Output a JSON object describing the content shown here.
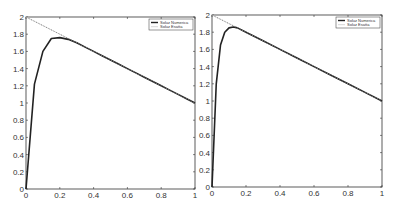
{
  "chart_data": [
    {
      "type": "line",
      "title": "",
      "xlabel": "",
      "ylabel": "",
      "xlim": [
        0,
        1
      ],
      "ylim": [
        0,
        2
      ],
      "xticks": [
        "0",
        "0.2",
        "0.4",
        "0.6",
        "0.8",
        "1"
      ],
      "yticks": [
        "0",
        "0.2",
        "0.4",
        "0.6",
        "0.8",
        "1",
        "1.2",
        "1.4",
        "1.6",
        "1.8",
        "2"
      ],
      "grid": false,
      "legend_position": "top-right",
      "series": [
        {
          "name": "Soluz Numerica",
          "style": "solid-thick-dark",
          "x": [
            0,
            0.05,
            0.1,
            0.15,
            0.2,
            0.25,
            0.3,
            0.35,
            0.4,
            0.45,
            0.5,
            0.55,
            0.6,
            0.65,
            0.7,
            0.75,
            0.8,
            0.85,
            0.9,
            0.95,
            1.0
          ],
          "y": [
            0,
            1.22,
            1.6,
            1.75,
            1.76,
            1.74,
            1.7,
            1.65,
            1.6,
            1.55,
            1.5,
            1.45,
            1.4,
            1.35,
            1.3,
            1.25,
            1.2,
            1.15,
            1.1,
            1.05,
            1.0
          ]
        },
        {
          "name": "Soluz Esatta",
          "style": "thin-light-dotted",
          "x": [
            0,
            1
          ],
          "y": [
            2,
            1
          ]
        }
      ]
    },
    {
      "type": "line",
      "title": "",
      "xlabel": "",
      "ylabel": "",
      "xlim": [
        0,
        1
      ],
      "ylim": [
        0,
        2
      ],
      "xticks": [
        "0",
        "0.2",
        "0.4",
        "0.6",
        "0.8",
        "1"
      ],
      "yticks": [
        "0",
        "0.2",
        "0.4",
        "0.6",
        "0.8",
        "1",
        "1.2",
        "1.4",
        "1.6",
        "1.8",
        "2"
      ],
      "grid": false,
      "legend_position": "top-right",
      "series": [
        {
          "name": "Soluz Numerica",
          "style": "solid-thick-dark",
          "x": [
            0,
            0.025,
            0.05,
            0.075,
            0.1,
            0.125,
            0.15,
            0.2,
            0.3,
            0.4,
            0.5,
            0.6,
            0.7,
            0.8,
            0.9,
            1.0
          ],
          "y": [
            0,
            1.2,
            1.65,
            1.8,
            1.85,
            1.86,
            1.85,
            1.8,
            1.7,
            1.6,
            1.5,
            1.4,
            1.3,
            1.2,
            1.1,
            1.0
          ]
        },
        {
          "name": "Soluz Esatta",
          "style": "thin-light-dotted",
          "x": [
            0,
            1
          ],
          "y": [
            2,
            1
          ]
        }
      ]
    }
  ],
  "panels": [
    {
      "legend": {
        "items": [
          "Soluz Numerica",
          "Soluz Esatta"
        ]
      }
    },
    {
      "legend": {
        "items": [
          "Soluz Numerica",
          "Soluz Esatta"
        ]
      }
    }
  ],
  "colors": {
    "numeric": "#222222",
    "exact": "#aaaaaa",
    "axis": "#333333"
  }
}
